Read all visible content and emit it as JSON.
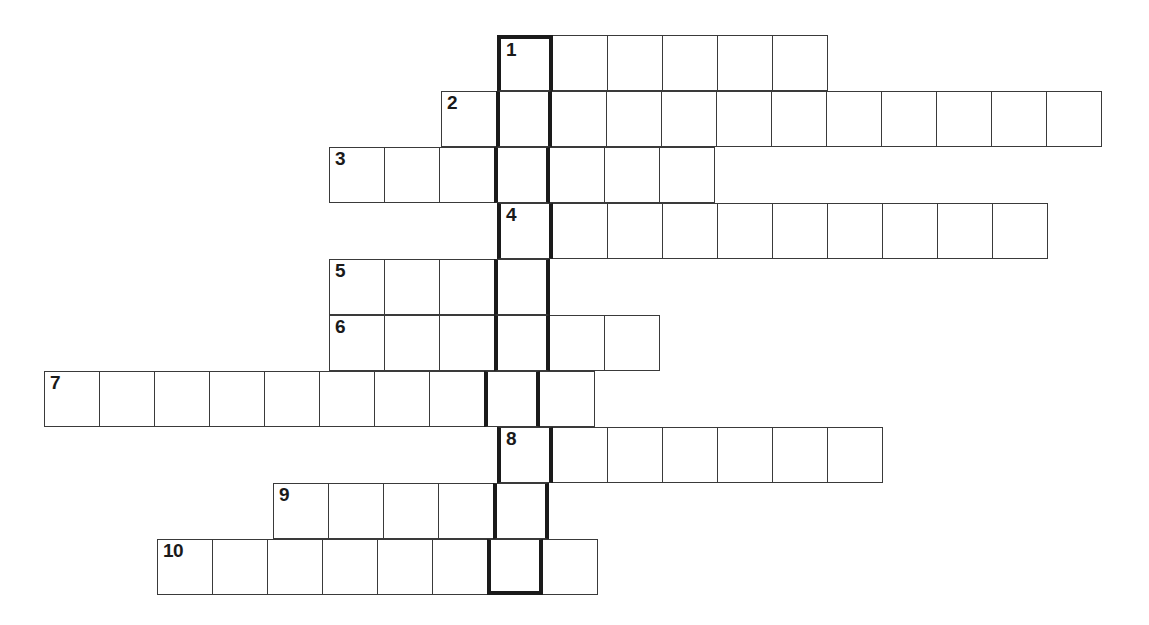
{
  "document": {
    "type": "crossword-puzzle-grid",
    "title": "Crossword Puzzle Grid",
    "background_color": "#ffffff",
    "cell_border_color": "#3a3a3a",
    "highlight_border_color": "#1a1a1a",
    "number_color": "#1a1a1a"
  },
  "grid": {
    "cell_size": 56,
    "origin_x": 44,
    "origin_y": 35,
    "columns": 20,
    "rows": 10,
    "highlight_column_index": 8,
    "highlight_column_label": "bold vertical answer column",
    "normal_line_width": 1,
    "bold_line_width": 4
  },
  "entries": [
    {
      "number": "1",
      "row": 0,
      "start_col": 8,
      "length": 6,
      "x": 497,
      "y": 35,
      "width": 336,
      "numbered_cell_index": 0
    },
    {
      "number": "2",
      "row": 1,
      "start_col": 7,
      "length": 12,
      "x": 441,
      "y": 91,
      "width": 672,
      "numbered_cell_index": 0
    },
    {
      "number": "3",
      "row": 2,
      "start_col": 5,
      "length": 7,
      "x": 329,
      "y": 147,
      "width": 392,
      "numbered_cell_index": 0
    },
    {
      "number": "4",
      "row": 3,
      "start_col": 8,
      "length": 10,
      "x": 497,
      "y": 203,
      "width": 560,
      "numbered_cell_index": 0
    },
    {
      "number": "5",
      "row": 4,
      "start_col": 5,
      "length": 4,
      "x": 329,
      "y": 259,
      "width": 224,
      "numbered_cell_index": 0
    },
    {
      "number": "6",
      "row": 5,
      "start_col": 5,
      "length": 6,
      "x": 329,
      "y": 315,
      "width": 336,
      "numbered_cell_index": 0
    },
    {
      "number": "7",
      "row": 6,
      "start_col": 0,
      "length": 10,
      "x": 44,
      "y": 371,
      "width": 560,
      "numbered_cell_index": 0
    },
    {
      "number": "8",
      "row": 7,
      "start_col": 8,
      "length": 7,
      "x": 497,
      "y": 427,
      "width": 392,
      "numbered_cell_index": 0
    },
    {
      "number": "9",
      "row": 8,
      "start_col": 4,
      "length": 5,
      "x": 273,
      "y": 483,
      "width": 280,
      "numbered_cell_index": 0
    },
    {
      "number": "10",
      "row": 9,
      "start_col": 2,
      "length": 8,
      "x": 157,
      "y": 539,
      "width": 448,
      "numbered_cell_index": 0
    }
  ],
  "chart_data": {
    "type": "table",
    "columns": [
      "Clue number",
      "Start column",
      "Letters (cells)",
      "Crosses bold column at letter"
    ],
    "rows": [
      [
        "1",
        8,
        6,
        1
      ],
      [
        "2",
        7,
        12,
        2
      ],
      [
        "3",
        5,
        7,
        4
      ],
      [
        "4",
        8,
        10,
        1
      ],
      [
        "5",
        5,
        4,
        4
      ],
      [
        "6",
        5,
        6,
        4
      ],
      [
        "7",
        0,
        10,
        9
      ],
      [
        "8",
        8,
        7,
        1
      ],
      [
        "9",
        4,
        5,
        5
      ],
      [
        "10",
        2,
        8,
        7
      ]
    ],
    "numbers": [
      "1",
      "2",
      "3",
      "4",
      "5",
      "6",
      "7",
      "8",
      "9",
      "10"
    ],
    "lengths": [
      6,
      12,
      7,
      10,
      4,
      6,
      10,
      7,
      5,
      8
    ],
    "start_columns": [
      8,
      7,
      5,
      8,
      5,
      5,
      0,
      8,
      4,
      2
    ]
  }
}
